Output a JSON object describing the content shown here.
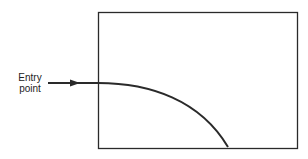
{
  "diagram": {
    "entry_label_line1": "Entry",
    "entry_label_line2": "point",
    "colors": {
      "stroke": "#2a2a2a",
      "background": "#ffffff"
    }
  }
}
